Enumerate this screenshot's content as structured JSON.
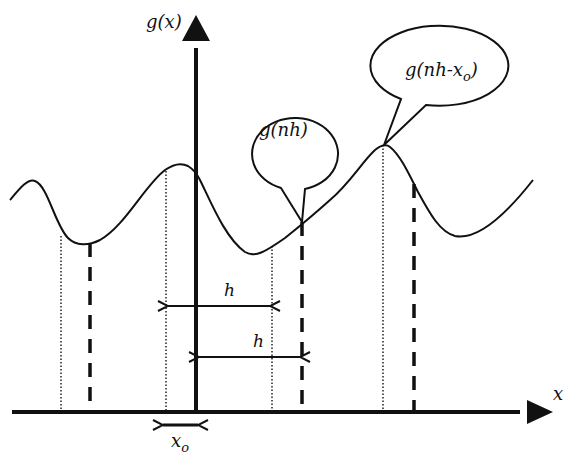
{
  "diagram": {
    "axes": {
      "y_label": "g(x)",
      "x_label": "x"
    },
    "callouts": [
      {
        "id": "gnh",
        "text_main": "g(nh)",
        "sub": ""
      },
      {
        "id": "gnhxo",
        "text_main": "g(nh-x",
        "sub": "o",
        "close": ")"
      }
    ],
    "intervals": [
      {
        "label": "h",
        "from": "dotted sample",
        "to": "next dotted sample"
      },
      {
        "label": "h",
        "from": "y-axis (origin)",
        "to": "dashed sample"
      }
    ],
    "offset": {
      "label_main": "x",
      "label_sub": "o"
    },
    "legend_notes": {
      "dotted_lines": "samples at nh - x_o",
      "dashed_lines": "samples at nh"
    },
    "colors": {
      "stroke": "#111111",
      "background": "#ffffff"
    }
  }
}
